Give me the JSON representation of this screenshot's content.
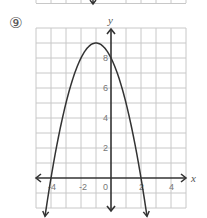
{
  "problem": {
    "number_label": "⑨"
  },
  "chart_data": {
    "type": "line",
    "title": "",
    "function": "y = -x^2 - 2x + 8",
    "xlabel": "x",
    "ylabel": "y",
    "xlim": [
      -5,
      5
    ],
    "ylim": [
      -2,
      10
    ],
    "grid": true,
    "x_ticks": [
      {
        "v": -4,
        "label": "-4"
      },
      {
        "v": -2,
        "label": "-2"
      },
      {
        "v": 0,
        "label": "0"
      },
      {
        "v": 2,
        "label": "2"
      },
      {
        "v": 4,
        "label": "4"
      }
    ],
    "y_ticks": [
      {
        "v": 2,
        "label": "2"
      },
      {
        "v": 4,
        "label": "4"
      },
      {
        "v": 6,
        "label": "6"
      },
      {
        "v": 8,
        "label": "8"
      }
    ],
    "vertex": [
      -1,
      9
    ],
    "roots": [
      -4,
      2
    ],
    "y_intercept": 8,
    "x": [
      -4.4,
      -4,
      -3,
      -2,
      -1,
      0,
      1,
      2,
      2.4
    ],
    "values": [
      -1.76,
      0,
      5,
      8,
      9,
      8,
      5,
      0,
      -1.76
    ]
  },
  "labels": {
    "x_axis": "x",
    "y_axis": "y",
    "tick_x_neg4": "-4",
    "tick_x_neg2": "-2",
    "tick_x_0": "0",
    "tick_x_2": "2",
    "tick_x_4": "4",
    "tick_y_2": "2",
    "tick_y_4": "4",
    "tick_y_6": "6",
    "tick_y_8": "8"
  }
}
